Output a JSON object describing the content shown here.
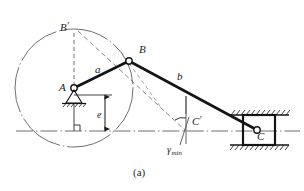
{
  "figure": {
    "caption": "(a)",
    "type": "offset-slider-crank-mechanism-diagram",
    "background_color": "#ffffff",
    "line_color": "#1a1a1a",
    "thin_line_color": "#4a4a4a"
  },
  "labels": {
    "pivot_a": "A",
    "joint_b": "B",
    "joint_b_prime_base": "B",
    "joint_b_prime_mark": "′",
    "slider_c": "C",
    "point_c_prime_base": "C",
    "point_c_prime_mark": "′",
    "crank_length": "a",
    "rod_length": "b",
    "offset": "e",
    "gamma_base": "γ",
    "gamma_sub": "min"
  },
  "geometry": {
    "circle": {
      "cx": 74,
      "cy": 88,
      "r": 59
    },
    "pivot_a": {
      "x": 74,
      "y": 88
    },
    "joint_b": {
      "x": 129,
      "y": 61
    },
    "joint_b_prime": {
      "x": 74,
      "y": 29
    },
    "slider_c": {
      "x": 257,
      "y": 130
    },
    "point_c_prime": {
      "x": 186,
      "y": 131
    },
    "ground_line_y": 131,
    "offset_e_x": 105,
    "offset_e_top": 95,
    "offset_e_bottom": 131,
    "crank_label_pos": {
      "x": 98,
      "y": 70
    },
    "rod_label_pos": {
      "x": 180,
      "y": 77
    },
    "gamma_arc_center": {
      "x": 184,
      "y": 125
    },
    "gamma_arc_radius": 13
  },
  "annotations": {
    "crank_link": "crank AB of length a",
    "connecting_rod": "connecting rod BC of length b",
    "offset_dimension": "offset e between pivot A and slider guide line",
    "transmission_angle": "minimum transmission angle gamma min at C'",
    "alternate_position": "alternate crank position B' with corresponding C'"
  }
}
